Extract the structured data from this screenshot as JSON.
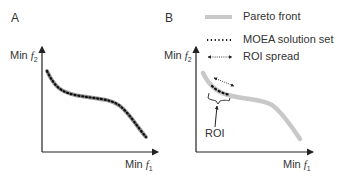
{
  "panels": [
    {
      "label": "A",
      "y_axis": {
        "prefix": "Min",
        "var": "f",
        "sub": "2"
      },
      "x_axis": {
        "prefix": "Min",
        "var": "f",
        "sub": "1"
      }
    },
    {
      "label": "B",
      "y_axis": {
        "prefix": "Min",
        "var": "f",
        "sub": "2"
      },
      "x_axis": {
        "prefix": "Min",
        "var": "f",
        "sub": "1"
      },
      "annotation": "ROI"
    }
  ],
  "legend": [
    {
      "label": "Pareto front",
      "style": "thick-gray-line",
      "color": "#c8c8c8"
    },
    {
      "label": "MOEA solution set",
      "style": "dotted-black",
      "color": "#222222"
    },
    {
      "label": "ROI spread",
      "style": "dotted-double-arrow",
      "color": "#222222"
    }
  ]
}
